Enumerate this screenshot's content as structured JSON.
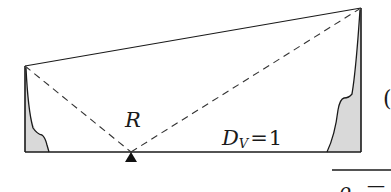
{
  "diagram": {
    "type": "structural-influence-diagram",
    "labels": {
      "reaction": "R",
      "dv_symbol": "D",
      "dv_subscript": "V",
      "dv_equals": "=",
      "dv_value": "1",
      "right_paren": "(",
      "bottom_fragment_symbol": "ρ",
      "bottom_fragment_dash": "—"
    },
    "colors": {
      "stroke": "#1a1a1a",
      "shade": "#d9d9d9",
      "background": "#ffffff"
    },
    "geometry": {
      "baseline_y": 152,
      "left_wall_x": 25,
      "left_wall_top_y": 66,
      "right_wall_x": 361,
      "right_wall_top_y": 8,
      "support_x": 131
    }
  }
}
